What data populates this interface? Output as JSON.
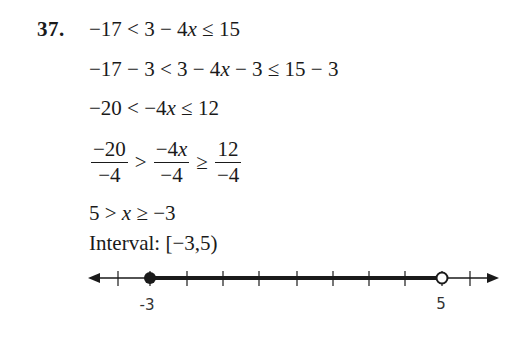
{
  "problem": {
    "number": "37.",
    "steps": [
      "−17 < 3 − 4x ≤ 15",
      "−17 − 3 < 3 − 4x − 3 ≤ 15 − 3",
      "−20 < −4x ≤ 12",
      "−20/−4 > −4x/−4 ≥ 12/−4",
      "5 > x ≥ −3"
    ],
    "step1": {
      "a": "−17 < 3 − 4",
      "var": "x",
      "b": " ≤ 15"
    },
    "step2": {
      "a": "−17 − 3 < 3 − 4",
      "var": "x",
      "b": " − 3 ≤ 15 − 3"
    },
    "step3": {
      "a": "−20 < −4",
      "var": "x",
      "b": " ≤ 12"
    },
    "step4": {
      "frac1": {
        "num": "−20",
        "den": "−4"
      },
      "rel1": ">",
      "frac2": {
        "num": "−4",
        "num_var": "x",
        "den": "−4"
      },
      "rel2": "≥",
      "frac3": {
        "num": "12",
        "den": "−4"
      }
    },
    "step5": {
      "a": "5 > ",
      "var": "x",
      "b": " ≥ −3"
    },
    "interval": {
      "label": "Interval:",
      "value": "[−3,5)"
    }
  },
  "number_line": {
    "min_visible": -4,
    "max_visible": 6,
    "ticks": [
      -4,
      -3,
      -2,
      -1,
      0,
      1,
      2,
      3,
      4,
      5,
      6
    ],
    "left_endpoint": {
      "value": -3,
      "type": "closed",
      "label": "-3"
    },
    "right_endpoint": {
      "value": 5,
      "type": "open",
      "label": "5"
    },
    "line_color": "#1a1a1a"
  }
}
